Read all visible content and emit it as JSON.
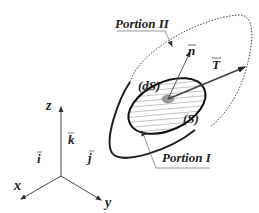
{
  "diagram": {
    "type": "continuum-mechanics-stress-vector",
    "labels": {
      "portion_2": "Portion II",
      "portion_1": "Portion I",
      "normal_vector": "n",
      "traction_vector": "T",
      "element_area": "(dS)",
      "section": "(S)"
    },
    "axes": {
      "x_label": "x",
      "y_label": "y",
      "z_label": "z",
      "i_label": "i",
      "j_label": "j",
      "k_label": "k"
    },
    "colors": {
      "stroke": "#222222",
      "hatch": "#555555",
      "patch_fill": "#999999",
      "background": "#ffffff"
    }
  }
}
